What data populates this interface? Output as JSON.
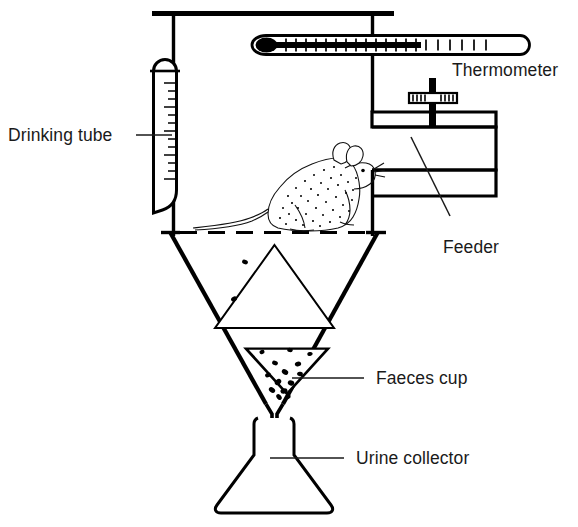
{
  "figure": {
    "width": 578,
    "height": 527,
    "background_color": "#ffffff",
    "ink_color": "#000000",
    "text_color": "#1a1a1a"
  },
  "labels": {
    "drinking_tube": "Drinking tube",
    "thermometer": "Thermometer",
    "feeder": "Feeder",
    "faeces_cup": "Faeces cup",
    "urine_collector": "Urine collector"
  },
  "parts": {
    "cage": {
      "name": "cage-body",
      "description": "Rectangular housing chamber with top bar and vertical side walls"
    },
    "mesh_floor": {
      "name": "mesh-floor",
      "description": "Dashed horizontal line representing the wire mesh floor"
    },
    "funnel": {
      "name": "separating-funnel",
      "description": "Large inverted cone below the mesh floor"
    },
    "inner_cone": {
      "name": "inner-separator-cone",
      "description": "Upward pointing cone that deflects urine to the funnel walls"
    },
    "faeces_cup": {
      "name": "faeces-cup",
      "description": "Small inverted triangular cup holding faecal pellets"
    },
    "spout": {
      "name": "funnel-spout",
      "description": "Narrow tube delivering urine into the flask"
    },
    "flask": {
      "name": "erlenmeyer-flask",
      "description": "Conical urine collection flask"
    },
    "drinking_tube": {
      "name": "graduated-drinking-tube",
      "description": "Graduated water tube with curved delivery spout"
    },
    "thermometer": {
      "name": "thermometer",
      "description": "Horizontal thermometer with filled bulb and scale marks"
    },
    "feeder": {
      "name": "feeder",
      "description": "Food hopper with threaded adjustment rod and feeding trough"
    },
    "rodent": {
      "name": "rodent",
      "description": "Mouse standing on the mesh floor facing the feeder"
    }
  },
  "pellet_counts": {
    "in_funnel": 2,
    "in_cup": 14
  }
}
